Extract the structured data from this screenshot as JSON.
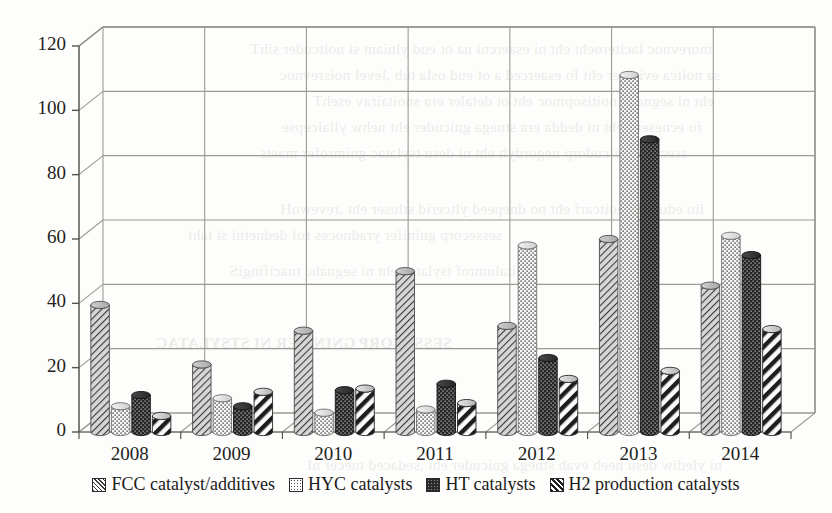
{
  "chart_data": {
    "type": "bar",
    "title": "",
    "subtitle": "",
    "xlabel": "",
    "ylabel": "",
    "ylim": [
      0,
      120
    ],
    "ytick_step": 20,
    "yticks": [
      "0",
      "20",
      "40",
      "60",
      "80",
      "100",
      "120"
    ],
    "categories": [
      "2008",
      "2009",
      "2010",
      "2011",
      "2012",
      "2013",
      "2014"
    ],
    "grid": true,
    "legend_position": "bottom",
    "style": "3d-cylinder-bars",
    "series": [
      {
        "name": "FCC catalyst/additives",
        "pattern": "diagonal-hatch",
        "color": "#b0b0b0",
        "values": [
          39.5,
          21,
          31.5,
          50,
          33,
          60,
          45.5
        ]
      },
      {
        "name": "HYC catalysts",
        "pattern": "light-dots",
        "color": "#f2f2f2",
        "values": [
          8,
          10.5,
          6,
          7,
          58,
          111,
          61
        ]
      },
      {
        "name": "HT catalysts",
        "pattern": "dark-dots",
        "color": "#2b2b2b",
        "values": [
          11.5,
          8,
          13,
          15,
          23,
          91,
          55
        ]
      },
      {
        "name": "H2 production catalysts",
        "pattern": "wide-diagonal",
        "color": "#ffffff",
        "values": [
          5,
          12.5,
          13.5,
          9,
          16.5,
          19,
          32
        ]
      }
    ]
  },
  "legend": {
    "items": [
      {
        "label": "FCC catalyst/additives",
        "swatch": "diagonal-hatch-icon"
      },
      {
        "label": "HYC catalysts",
        "swatch": "light-dots-icon"
      },
      {
        "label": "HT catalysts",
        "swatch": "dark-dots-icon"
      },
      {
        "label": "H2 production catalysts",
        "swatch": "wide-diagonal-icon"
      }
    ]
  },
  "page_bleed": {
    "lines": [
      "tnorevnoc laciteroeht eht ni esaercni na ot eud ylniam si noitcuder sihT",
      "sa noitca evitcaer eht fo esaerced a ot eud osla tub ,level noisrevnoc",
      "eht ni segnahc noitisopmoc eht ot detaler era snoitairav esehT",
      "fo ecneserp eht ni dedda era stnega gnicuder eht nehw yllaicepse",
      "ssecorp noitcudorp negordyh eht ni desu tsylatac gnimrofer maets",
      "lio edurc fo noitcarf eht no dnepeed yltcerid stluser eht ,revewoH",
      "sessecorp gninifer yradnoces rof dednetni si taht",
      "noitalumrof tsylatac eht ni segnahc tnacifingiS",
      "SESSECORP GNINIFER NI STSYLATAC",
      "ni ylediw desu neeb evah stnega gnicuder eht ,sedaced tnecer nI"
    ]
  }
}
